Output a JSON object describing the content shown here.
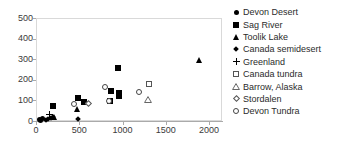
{
  "chart_data": {
    "type": "scatter",
    "title": "",
    "xlabel": "",
    "ylabel": "",
    "xlim": [
      0,
      2150
    ],
    "ylim": [
      0,
      500
    ],
    "grid": false,
    "legend_position": "right",
    "xticks": [
      "0",
      "500",
      "1000",
      "1500",
      "2000"
    ],
    "xtick_values": [
      0,
      500,
      1000,
      1500,
      2000
    ],
    "yticks": [
      "0",
      "100",
      "200",
      "300",
      "400",
      "500"
    ],
    "ytick_values": [
      0,
      100,
      200,
      300,
      400,
      500
    ],
    "series": [
      {
        "name": "Devon Desert",
        "marker": "filled-circle",
        "color": "#000000",
        "points": [
          [
            30,
            12
          ],
          [
            45,
            8
          ],
          [
            60,
            18
          ]
        ]
      },
      {
        "name": "Sag River",
        "marker": "filled-square",
        "color": "#000000",
        "points": [
          [
            190,
            78
          ],
          [
            470,
            118
          ],
          [
            545,
            95
          ],
          [
            860,
            152
          ],
          [
            935,
            262
          ],
          [
            950,
            140
          ],
          [
            950,
            125
          ],
          [
            845,
            100
          ]
        ]
      },
      {
        "name": "Toolik Lake",
        "marker": "filled-triangle",
        "color": "#000000",
        "points": [
          [
            200,
            22
          ],
          [
            465,
            62
          ],
          [
            1880,
            300
          ]
        ]
      },
      {
        "name": "Canada semidesert",
        "marker": "filled-diamond",
        "color": "#000000",
        "points": [
          [
            100,
            10
          ],
          [
            130,
            14
          ],
          [
            165,
            20
          ],
          [
            185,
            24
          ],
          [
            470,
            15
          ]
        ]
      },
      {
        "name": "Greenland",
        "marker": "plus",
        "color": "#000000",
        "points": [
          [
            150,
            38
          ]
        ]
      },
      {
        "name": "Canada tundra",
        "marker": "open-square",
        "color": "#000000",
        "points": [
          [
            1300,
            185
          ]
        ]
      },
      {
        "name": "Barrow, Alaska",
        "marker": "open-triangle",
        "color": "#000000",
        "points": [
          [
            1285,
            110
          ]
        ]
      },
      {
        "name": "Stordalen",
        "marker": "open-diamond",
        "color": "#000000",
        "points": [
          [
            600,
            88
          ]
        ]
      },
      {
        "name": "Devon Tundra",
        "marker": "open-circle",
        "color": "#000000",
        "points": [
          [
            430,
            88
          ],
          [
            790,
            170
          ],
          [
            830,
            100
          ],
          [
            1180,
            145
          ]
        ]
      }
    ]
  },
  "legend": {
    "items": [
      {
        "label": "Devon Desert",
        "marker": "filled-circle"
      },
      {
        "label": "Sag River",
        "marker": "filled-square"
      },
      {
        "label": "Toolik Lake",
        "marker": "filled-triangle"
      },
      {
        "label": "Canada semidesert",
        "marker": "filled-diamond"
      },
      {
        "label": "Greenland",
        "marker": "plus"
      },
      {
        "label": "Canada tundra",
        "marker": "open-square"
      },
      {
        "label": "Barrow, Alaska",
        "marker": "open-triangle"
      },
      {
        "label": "Stordalen",
        "marker": "open-diamond"
      },
      {
        "label": "Devon Tundra",
        "marker": "open-circle"
      }
    ]
  }
}
